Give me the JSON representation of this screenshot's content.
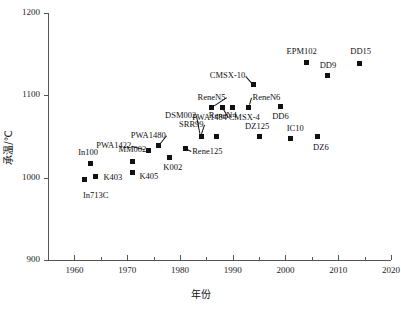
{
  "chart_data": {
    "type": "scatter",
    "title": "",
    "xlabel": "年份",
    "ylabel": "承温/℃",
    "xlim": [
      1955,
      2020
    ],
    "ylim": [
      900,
      1200
    ],
    "grid": false,
    "legend": null,
    "xticks": [
      1960,
      1970,
      1980,
      1990,
      2000,
      2010,
      2020
    ],
    "xticks_minor": [
      1965,
      1975,
      1985,
      1995,
      2005,
      2015
    ],
    "yticks": [
      900,
      1000,
      1100,
      1200
    ],
    "points": [
      {
        "label": "In713C",
        "x": 1962,
        "y": 998,
        "label_dx": -2,
        "label_dy": 16,
        "leader": false
      },
      {
        "label": "K403",
        "x": 1964,
        "y": 1002,
        "label_dx": 8,
        "label_dy": 1,
        "leader": false
      },
      {
        "label": "In100",
        "x": 1963,
        "y": 1017,
        "label_dx": -12,
        "label_dy": -12,
        "leader": false
      },
      {
        "label": "MM002",
        "x": 1971,
        "y": 1020,
        "label_dx": -14,
        "label_dy": -12,
        "leader": false
      },
      {
        "label": "K405",
        "x": 1971,
        "y": 1006,
        "label_dx": 7,
        "label_dy": 3,
        "leader": false
      },
      {
        "label": "PWA1422",
        "x": 1974,
        "y": 1033,
        "label_dx": -52,
        "label_dy": -5,
        "leader": true
      },
      {
        "label": "PWA1480",
        "x": 1976,
        "y": 1039,
        "label_dx": -28,
        "label_dy": -11,
        "leader": true
      },
      {
        "label": "K002",
        "x": 1978,
        "y": 1025,
        "label_dx": -6,
        "label_dy": 10,
        "leader": false
      },
      {
        "label": "Rene125",
        "x": 1981,
        "y": 1035,
        "label_dx": 7,
        "label_dy": 2,
        "leader": true
      },
      {
        "label": "DSM002",
        "x": 1984,
        "y": 1050,
        "label_dx": -36,
        "label_dy": -22,
        "leader": true
      },
      {
        "label": "ReneN4",
        "x": 1987,
        "y": 1050,
        "label_dx": -8,
        "label_dy": -22,
        "leader": false
      },
      {
        "label": "SRR99",
        "x": 1984,
        "y": 1050,
        "label_dx": -22,
        "label_dy": -13,
        "leader": true
      },
      {
        "label": "PWA1484",
        "x": 1988,
        "y": 1085,
        "label_dx": -30,
        "label_dy": 9,
        "leader": true
      },
      {
        "label": "CMSX-4",
        "x": 1990,
        "y": 1085,
        "label_dx": -4,
        "label_dy": 9,
        "leader": false
      },
      {
        "label": "ReneN5",
        "x": 1986,
        "y": 1085,
        "label_dx": -14,
        "label_dy": -11,
        "leader": true
      },
      {
        "label": "ReneN6",
        "x": 1993,
        "y": 1085,
        "label_dx": 4,
        "label_dy": -11,
        "leader": true
      },
      {
        "label": "CMSX-10",
        "x": 1994,
        "y": 1113,
        "label_dx": -44,
        "label_dy": -10,
        "leader": true
      },
      {
        "label": "DZ125",
        "x": 1995,
        "y": 1050,
        "label_dx": -14,
        "label_dy": -11,
        "leader": false
      },
      {
        "label": "DD6",
        "x": 1999,
        "y": 1086,
        "label_dx": -8,
        "label_dy": 9,
        "leader": false
      },
      {
        "label": "IC10",
        "x": 2001,
        "y": 1047,
        "label_dx": -4,
        "label_dy": -11,
        "leader": false
      },
      {
        "label": "DZ6",
        "x": 2006,
        "y": 1050,
        "label_dx": -4,
        "label_dy": 10,
        "leader": false
      },
      {
        "label": "EPM102",
        "x": 2004,
        "y": 1140,
        "label_dx": -20,
        "label_dy": -11,
        "leader": false
      },
      {
        "label": "DD9",
        "x": 2008,
        "y": 1124,
        "label_dx": -8,
        "label_dy": -11,
        "leader": false
      },
      {
        "label": "DD15",
        "x": 2014,
        "y": 1139,
        "label_dx": -9,
        "label_dy": -12,
        "leader": false
      }
    ]
  },
  "colors": {
    "marker": "#111111",
    "axis": "#555555",
    "text": "#111111",
    "background": "#ffffff"
  }
}
